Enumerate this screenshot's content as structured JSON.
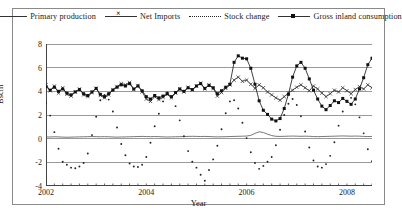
{
  "chart_data": {
    "type": "line",
    "title": "",
    "xlabel": "Year",
    "ylabel": "Bscm",
    "ylim": [
      -4,
      8
    ],
    "ytick_labels": [
      "8",
      "6",
      "4",
      "2",
      "0",
      "-2",
      "-4"
    ],
    "ytick_values": [
      8,
      6,
      4,
      2,
      0,
      -2,
      -4
    ],
    "xlim": [
      2002,
      2008.5
    ],
    "xtick_labels": [
      "2002",
      "2004",
      "2006",
      "2008"
    ],
    "xtick_values": [
      2002,
      2004,
      2006,
      2008
    ],
    "grid": "horizontal",
    "legend_position": "top",
    "x_start": 2002,
    "x_step": 0.0833333,
    "series": [
      {
        "name": "Primary production",
        "style": "solid",
        "marker": "none",
        "color": "#555555",
        "values": [
          0.15,
          0.14,
          0.16,
          0.15,
          0.13,
          0.12,
          0.13,
          0.14,
          0.15,
          0.16,
          0.17,
          0.18,
          0.17,
          0.16,
          0.17,
          0.16,
          0.14,
          0.13,
          0.14,
          0.15,
          0.16,
          0.17,
          0.18,
          0.19,
          0.18,
          0.17,
          0.18,
          0.17,
          0.15,
          0.14,
          0.15,
          0.16,
          0.17,
          0.18,
          0.19,
          0.2,
          0.19,
          0.18,
          0.19,
          0.18,
          0.16,
          0.15,
          0.16,
          0.17,
          0.18,
          0.19,
          0.2,
          0.21,
          0.22,
          0.28,
          0.45,
          0.58,
          0.52,
          0.38,
          0.26,
          0.2,
          0.19,
          0.2,
          0.21,
          0.22,
          0.21,
          0.2,
          0.21,
          0.2,
          0.18,
          0.17,
          0.18,
          0.19,
          0.2,
          0.21,
          0.22,
          0.23,
          0.22,
          0.21,
          0.22,
          0.21,
          0.19,
          0.18,
          0.19,
          0.2
        ]
      },
      {
        "name": "Net Imports",
        "style": "solid",
        "marker": "x",
        "color": "#333333",
        "values": [
          4.55,
          4.05,
          4.45,
          3.85,
          4.3,
          3.75,
          3.6,
          3.95,
          4.2,
          3.7,
          3.55,
          3.9,
          4.25,
          3.65,
          3.45,
          3.7,
          4.15,
          4.4,
          4.65,
          4.55,
          4.75,
          4.15,
          4.5,
          3.95,
          3.35,
          3.15,
          3.55,
          3.3,
          3.5,
          3.75,
          3.45,
          3.85,
          4.2,
          3.95,
          4.35,
          4.1,
          4.45,
          4.7,
          4.2,
          4.55,
          4.25,
          3.6,
          3.9,
          4.25,
          4.55,
          4.95,
          5.2,
          4.85,
          4.95,
          4.6,
          4.25,
          4.55,
          4.3,
          3.95,
          3.7,
          3.45,
          3.25,
          3.55,
          3.85,
          4.1,
          4.35,
          4.55,
          4.3,
          4.05,
          4.45,
          4.2,
          3.85,
          3.55,
          3.8,
          4.1,
          3.95,
          4.3,
          4.05,
          3.8,
          4.15,
          4.4,
          4.2,
          4.55,
          4.3,
          4.5
        ]
      },
      {
        "name": "Stock change",
        "style": "dotted",
        "marker": "dot",
        "color": "#222222",
        "values": [
          3.0,
          1.95,
          0.55,
          -0.85,
          -1.95,
          -2.2,
          -2.45,
          -2.5,
          -2.35,
          -2.05,
          -1.25,
          0.3,
          1.85,
          3.25,
          3.7,
          3.3,
          2.3,
          0.95,
          -0.45,
          -1.4,
          -2.1,
          -2.35,
          -2.4,
          -2.2,
          -1.55,
          -0.35,
          1.05,
          2.1,
          3.15,
          3.9,
          3.55,
          2.75,
          1.55,
          0.2,
          -1.05,
          -1.95,
          -2.45,
          -3.05,
          -3.55,
          -2.65,
          -1.75,
          -0.6,
          0.8,
          2.15,
          3.15,
          3.25,
          2.55,
          1.35,
          0.05,
          -1.15,
          -2.05,
          -2.55,
          -2.3,
          -1.95,
          -1.55,
          -0.55,
          0.75,
          2.0,
          2.95,
          3.35,
          2.85,
          1.9,
          0.6,
          -0.75,
          -1.85,
          -2.35,
          -2.45,
          -2.15,
          -1.45,
          -0.3,
          1.1,
          2.3,
          3.2,
          3.45,
          2.9,
          1.8,
          0.45,
          -0.9,
          -1.9,
          -2.3
        ]
      },
      {
        "name": "Gross inland consumption",
        "style": "solid",
        "marker": "square",
        "color": "#111111",
        "values": [
          4.4,
          4.1,
          4.35,
          4.0,
          4.2,
          3.85,
          3.7,
          3.95,
          4.15,
          3.8,
          3.65,
          3.95,
          4.25,
          3.75,
          3.55,
          3.8,
          4.1,
          4.35,
          4.55,
          4.45,
          4.65,
          4.2,
          4.45,
          4.05,
          3.55,
          3.35,
          3.65,
          3.45,
          3.6,
          3.8,
          3.55,
          3.9,
          4.2,
          4.0,
          4.3,
          4.15,
          4.45,
          4.65,
          4.25,
          4.5,
          4.3,
          3.8,
          4.05,
          4.35,
          4.6,
          6.45,
          7.0,
          6.8,
          6.75,
          5.95,
          4.6,
          3.2,
          2.4,
          2.05,
          1.65,
          1.5,
          1.7,
          2.55,
          3.75,
          5.2,
          6.15,
          6.45,
          5.95,
          5.05,
          4.1,
          3.35,
          2.75,
          2.45,
          2.8,
          3.2,
          3.05,
          3.4,
          3.15,
          2.9,
          3.35,
          4.2,
          5.15,
          6.25,
          6.8,
          6.05
        ]
      }
    ]
  },
  "legend": {
    "items": [
      {
        "label": "Primary production",
        "key": "solid"
      },
      {
        "label": "Net Imports",
        "key": "xmark"
      },
      {
        "label": "Stock change",
        "key": "dotted"
      },
      {
        "label": "Gross inland consumption",
        "key": "square"
      }
    ]
  },
  "axes": {
    "y_title": "Bscm",
    "x_title": "Year"
  },
  "colors": {
    "frame": "#8a8a8a",
    "grid": "#9a9a9a",
    "axis": "#444444",
    "background": "#ffffff"
  }
}
